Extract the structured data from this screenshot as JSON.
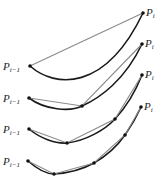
{
  "diagram": {
    "title": "",
    "colors": {
      "curve": "#1a1a1a",
      "chord": "#8a8a8a",
      "point": "#111111",
      "background": "#ffffff"
    },
    "labels": {
      "start": "P",
      "start_sub": "i−1",
      "end": "P",
      "end_sub": "i"
    },
    "rows": [
      {
        "level": 0,
        "start": [
          30,
          66
        ],
        "end": [
          143,
          13
        ],
        "curve_path": "M30,66 C55,88 105,92 143,13",
        "points": [
          [
            30,
            66
          ],
          [
            143,
            13
          ]
        ]
      },
      {
        "level": 1,
        "start": [
          29,
          98
        ],
        "end": [
          142,
          44
        ],
        "curve_path": "M29,98 C45,110 70,112 82,106 C100,98 125,80 142,44",
        "points": [
          [
            29,
            98
          ],
          [
            82,
            106
          ],
          [
            142,
            44
          ]
        ]
      },
      {
        "level": 2,
        "start": [
          29,
          129
        ],
        "end": [
          142,
          75
        ],
        "curve_path": "M29,129 C40,138 55,144 67,143 C85,141 105,130 115,119 C128,105 136,90 142,75",
        "points": [
          [
            29,
            129
          ],
          [
            67,
            143
          ],
          [
            115,
            119
          ],
          [
            142,
            75
          ]
        ]
      },
      {
        "level": 3,
        "start": [
          28,
          161
        ],
        "end": [
          141,
          107
        ],
        "curve_path": "M28,161 C36,168 45,174 54,174 C70,173 85,168 94,163 C108,155 118,145 125,135 C132,125 137,116 141,107",
        "points": [
          [
            28,
            161
          ],
          [
            54,
            174
          ],
          [
            94,
            163
          ],
          [
            125,
            135
          ],
          [
            141,
            107
          ]
        ]
      }
    ]
  }
}
